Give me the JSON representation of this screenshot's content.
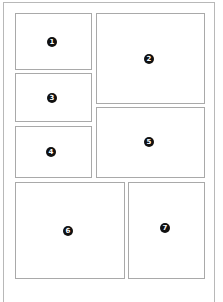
{
  "diagram": {
    "type": "page-layout-panels",
    "colors": {
      "background": "#ffffff",
      "page_border": "#b8b8b8",
      "panel_border": "#a9a9a9",
      "badge_fill": "#111111",
      "badge_text": "#ffffff"
    },
    "panels": [
      {
        "id": "1",
        "label": "1",
        "x": 15,
        "y": 13,
        "w": 77,
        "h": 57,
        "badge_x": 52,
        "badge_y": 42
      },
      {
        "id": "2",
        "label": "2",
        "x": 96,
        "y": 13,
        "w": 109,
        "h": 91,
        "badge_x": 149,
        "badge_y": 59
      },
      {
        "id": "3",
        "label": "3",
        "x": 15,
        "y": 73,
        "w": 77,
        "h": 49,
        "badge_x": 52,
        "badge_y": 98
      },
      {
        "id": "4",
        "label": "4",
        "x": 15,
        "y": 126,
        "w": 77,
        "h": 52,
        "badge_x": 51,
        "badge_y": 152
      },
      {
        "id": "5",
        "label": "5",
        "x": 96,
        "y": 107,
        "w": 109,
        "h": 71,
        "badge_x": 149,
        "badge_y": 142
      },
      {
        "id": "6",
        "label": "6",
        "x": 15,
        "y": 182,
        "w": 110,
        "h": 97,
        "badge_x": 68,
        "badge_y": 231
      },
      {
        "id": "7",
        "label": "7",
        "x": 128,
        "y": 182,
        "w": 77,
        "h": 97,
        "badge_x": 165,
        "badge_y": 228
      }
    ]
  }
}
